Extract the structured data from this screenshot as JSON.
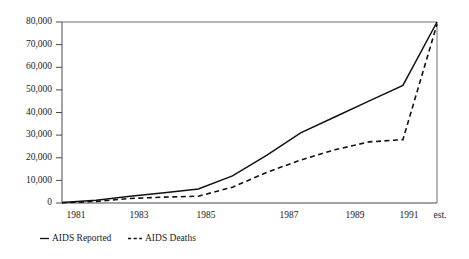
{
  "chart_data": {
    "type": "line",
    "title": "",
    "subtitle": "",
    "xlabel": "",
    "ylabel": "",
    "x": [
      "1981",
      "1982",
      "1983",
      "1984",
      "1985",
      "1986",
      "1987",
      "1988",
      "1989",
      "1990",
      "1991",
      "est."
    ],
    "xtick_labels": [
      "1981",
      "1983",
      "1985",
      "1987",
      "1989",
      "1991",
      "est."
    ],
    "ytick_labels": [
      "0",
      "10,000",
      "20,000",
      "30,000",
      "40,000",
      "50,000",
      "60,000",
      "70,000",
      "80,000"
    ],
    "ytick_values": [
      0,
      10000,
      20000,
      30000,
      40000,
      50000,
      60000,
      70000,
      80000
    ],
    "ylim": [
      0,
      80000
    ],
    "grid": false,
    "legend_position": "below-left",
    "series": [
      {
        "name": "AIDS Reported",
        "style": "solid",
        "color": "#111111",
        "values": [
          200,
          1200,
          3000,
          4500,
          6200,
          12000,
          21000,
          31000,
          38000,
          45000,
          52000,
          80000
        ]
      },
      {
        "name": "AIDS Deaths",
        "style": "dashed",
        "color": "#111111",
        "values": [
          100,
          700,
          2000,
          2600,
          3000,
          7000,
          13500,
          19000,
          23500,
          27000,
          28000,
          79000
        ]
      }
    ],
    "legend": [
      {
        "label": "AIDS Reported",
        "marker": "solid-line"
      },
      {
        "label": "AIDS Deaths",
        "marker": "dashed-line"
      }
    ],
    "axis_colors": {
      "axis": "#4a4a4a",
      "frame": "#6e6e6e",
      "background": "#ffffff"
    }
  }
}
